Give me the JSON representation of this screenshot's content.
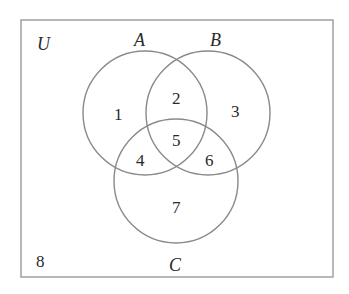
{
  "diagram": {
    "type": "venn-3-set",
    "universe_label": "U",
    "sets": [
      {
        "name": "A",
        "label": "A"
      },
      {
        "name": "B",
        "label": "B"
      },
      {
        "name": "C",
        "label": "C"
      }
    ],
    "regions": [
      {
        "id": "A_only",
        "label": "1"
      },
      {
        "id": "A_and_B_only",
        "label": "2"
      },
      {
        "id": "B_only",
        "label": "3"
      },
      {
        "id": "A_and_C_only",
        "label": "4"
      },
      {
        "id": "A_and_B_and_C",
        "label": "5"
      },
      {
        "id": "B_and_C_only",
        "label": "6"
      },
      {
        "id": "C_only",
        "label": "7"
      },
      {
        "id": "outside_all",
        "label": "8"
      }
    ]
  }
}
